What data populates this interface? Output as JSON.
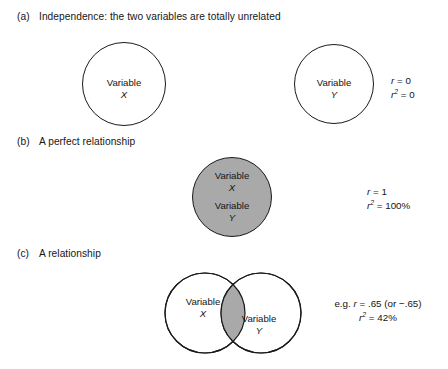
{
  "figure": {
    "colors": {
      "shade": "#a9a9a9",
      "stroke": "#1a1a1a",
      "background": "#ffffff",
      "text": "#141414"
    }
  },
  "sections": [
    {
      "letter": "(a)",
      "heading": "Independence: the two variables are totally unrelated",
      "circles": [
        {
          "label": "Variable",
          "symbol": "X",
          "shaded": false
        },
        {
          "label": "Variable",
          "symbol": "Y",
          "shaded": false
        }
      ],
      "stats": {
        "r_label": "r",
        "r_value": "= 0",
        "r2_label": "r",
        "r2_exp": "2",
        "r2_value": "= 0",
        "prefix": ""
      }
    },
    {
      "letter": "(b)",
      "heading": "A perfect relationship",
      "circles": [
        {
          "label": "Variable",
          "symbol": "X",
          "shaded": true
        },
        {
          "label": "Variable",
          "symbol": "Y",
          "shaded": true
        }
      ],
      "stats": {
        "r_label": "r",
        "r_value": "= 1",
        "r2_label": "r",
        "r2_exp": "2",
        "r2_value": "= 100%",
        "prefix": ""
      }
    },
    {
      "letter": "(c)",
      "heading": "A relationship",
      "circles": [
        {
          "label": "Variable",
          "symbol": "X",
          "shaded": false
        },
        {
          "label": "Variable",
          "symbol": "Y",
          "shaded": false
        }
      ],
      "stats": {
        "r_label": "r",
        "r_value": "= .65 (or −.65)",
        "r2_label": "r",
        "r2_exp": "2",
        "r2_value": "= 42%",
        "prefix": "e.g. "
      }
    }
  ]
}
